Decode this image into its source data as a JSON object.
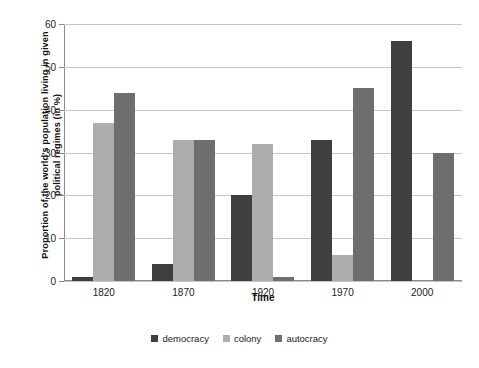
{
  "chart_data": {
    "type": "bar",
    "title": "",
    "subtitle": "",
    "xlabel": "Time",
    "ylabel": "Proportion of the world's population living in given political regimes (in %)",
    "ylabel_line1": "Proportion of the world's population living in given",
    "ylabel_line2": "political regimes (in %)",
    "categories": [
      "1820",
      "1870",
      "1920",
      "1970",
      "2000"
    ],
    "series": [
      {
        "name": "democracy",
        "color": "#3f3f3f",
        "values": [
          1,
          4,
          20,
          33,
          56
        ]
      },
      {
        "name": "colony",
        "color": "#adadad",
        "values": [
          37,
          33,
          32,
          6,
          0
        ]
      },
      {
        "name": "autocracy",
        "color": "#6e6e6e",
        "values": [
          44,
          33,
          1,
          45,
          30
        ]
      }
    ],
    "ylim": [
      0,
      60
    ],
    "ytick_values": [
      0,
      10,
      20,
      30,
      40,
      50,
      60
    ],
    "ytick_labels": [
      "0",
      "10",
      "20",
      "30",
      "40",
      "50",
      "60"
    ],
    "grid": true,
    "grid_axis": "y",
    "legend_position": "bottom",
    "legend_entries": [
      "democracy",
      "colony",
      "autocracy"
    ],
    "bar_layout": "grouped",
    "background_color": "#ffffff",
    "gridline_color": "#c6c6c6",
    "axis_color": "#8a8a8a"
  }
}
